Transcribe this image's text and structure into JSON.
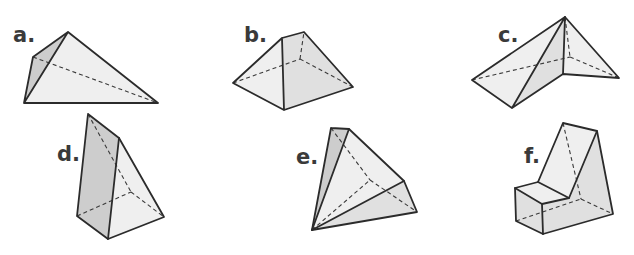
{
  "figure": {
    "type": "solid-shapes-worksheet",
    "shapes": [
      {
        "id": "a",
        "label": "a.",
        "description": "irregular pyramid with triangular faces"
      },
      {
        "id": "b",
        "label": "b.",
        "description": "truncated pyramid with square base"
      },
      {
        "id": "c",
        "label": "c.",
        "description": "compound triangular pyramid shape"
      },
      {
        "id": "d",
        "label": "d.",
        "description": "tall wedge / triangular prism"
      },
      {
        "id": "e",
        "label": "e.",
        "description": "tilted pyramid"
      },
      {
        "id": "f",
        "label": "f.",
        "description": "chair-like compound prism"
      }
    ],
    "colors": {
      "outline": "#2b2b2b",
      "face_light": "#efefef",
      "face_mid": "#e0e0e0",
      "face_dark": "#cdcdcd",
      "label": "#3a3a3a"
    }
  }
}
